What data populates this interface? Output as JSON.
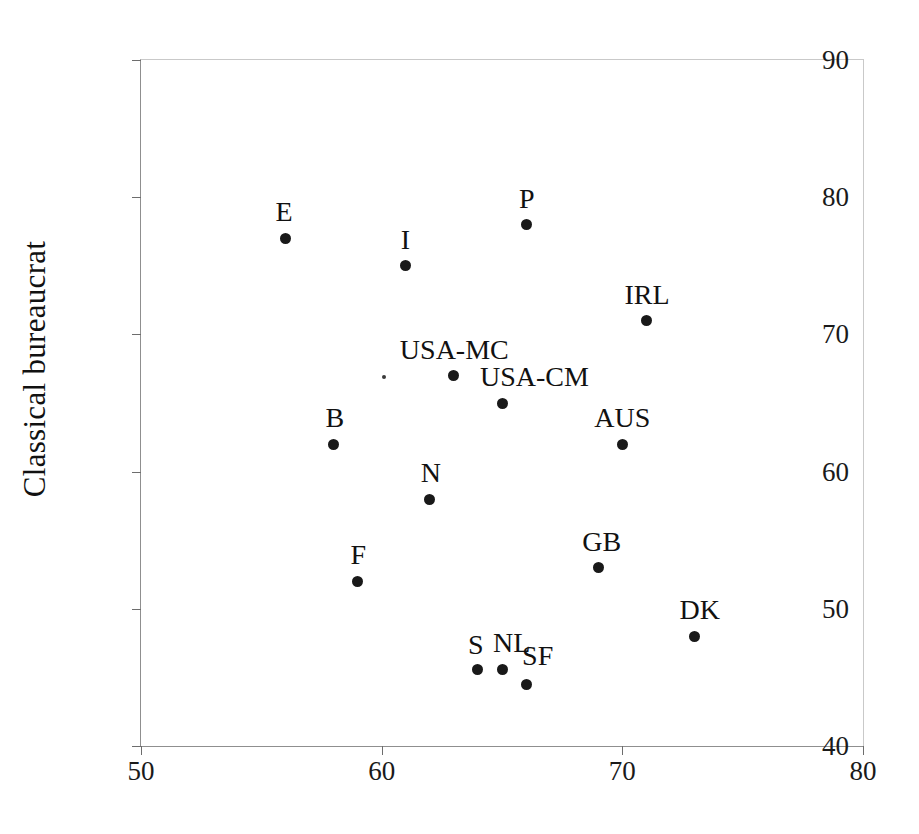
{
  "chart_data": {
    "type": "scatter",
    "title": "",
    "xlabel": "",
    "ylabel": "Classical bureaucrat",
    "xlim": [
      50,
      80
    ],
    "ylim": [
      40,
      90
    ],
    "xticks": [
      50,
      60,
      70,
      80
    ],
    "yticks": [
      40,
      50,
      60,
      70,
      80,
      90
    ],
    "grid": false,
    "legend": "none",
    "marker_color": "#191919",
    "points": [
      {
        "label": "E",
        "x": 56,
        "y": 77,
        "label_dx": -10,
        "label_dy": -40
      },
      {
        "label": "I",
        "x": 61,
        "y": 75,
        "label_dx": -5,
        "label_dy": -40
      },
      {
        "label": "P",
        "x": 66,
        "y": 78,
        "label_dx": -7,
        "label_dy": -40
      },
      {
        "label": "IRL",
        "x": 71,
        "y": 71,
        "label_dx": -22,
        "label_dy": -40
      },
      {
        "label": "USA-MC",
        "x": 63,
        "y": 67,
        "label_dx": -54,
        "label_dy": -40
      },
      {
        "label": "USA-CM",
        "x": 65,
        "y": 65,
        "label_dx": -22,
        "label_dy": -40
      },
      {
        "label": "B",
        "x": 58,
        "y": 62,
        "label_dx": -8,
        "label_dy": -40
      },
      {
        "label": "AUS",
        "x": 70,
        "y": 62,
        "label_dx": -28,
        "label_dy": -40
      },
      {
        "label": "N",
        "x": 62,
        "y": 58,
        "label_dx": -9,
        "label_dy": -40
      },
      {
        "label": "GB",
        "x": 69,
        "y": 53,
        "label_dx": -16,
        "label_dy": -40
      },
      {
        "label": "F",
        "x": 59,
        "y": 52,
        "label_dx": -7,
        "label_dy": -40
      },
      {
        "label": "DK",
        "x": 73,
        "y": 48,
        "label_dx": -15,
        "label_dy": -40
      },
      {
        "label": "S",
        "x": 64,
        "y": 45.6,
        "label_dx": -10,
        "label_dy": -38
      },
      {
        "label": "NL",
        "x": 65,
        "y": 45.6,
        "label_dx": -9,
        "label_dy": -40
      },
      {
        "label": "SF",
        "x": 66,
        "y": 44.5,
        "label_dx": -4,
        "label_dy": -42
      }
    ],
    "minor_marks": [
      {
        "x": 60.1,
        "y": 66.9
      }
    ]
  }
}
